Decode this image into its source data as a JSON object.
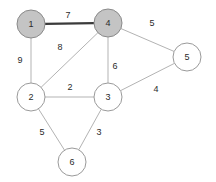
{
  "figure": {
    "type": "weighted-undirected-graph",
    "background_color": "#ffffff",
    "width": 216,
    "height": 182
  },
  "style": {
    "node_fill_default": "#ffffff",
    "node_fill_selected": "#c4c4c4",
    "node_stroke": "#9a9a9a",
    "edge_color": "#b3b3b3",
    "edge_highlight_color": "#3a3a3a",
    "label_color": "#2b2b2b",
    "node_radius": 14
  },
  "chart_data": {
    "type": "graph",
    "title": "",
    "nodes": [
      {
        "id": "1",
        "label": "1",
        "x": 31,
        "y": 24,
        "r": 14,
        "selected": true
      },
      {
        "id": "4",
        "label": "4",
        "x": 108,
        "y": 23,
        "r": 14,
        "selected": true
      },
      {
        "id": "5",
        "label": "5",
        "x": 187,
        "y": 57,
        "r": 14,
        "selected": false
      },
      {
        "id": "2",
        "label": "2",
        "x": 31,
        "y": 97,
        "r": 14,
        "selected": false
      },
      {
        "id": "3",
        "label": "3",
        "x": 108,
        "y": 97,
        "r": 14,
        "selected": false
      },
      {
        "id": "6",
        "label": "6",
        "x": 72,
        "y": 162,
        "r": 14,
        "selected": false
      }
    ],
    "edges": [
      {
        "from": "1",
        "to": "4",
        "weight": "7",
        "label_x": 68,
        "label_y": 16,
        "highlighted": true
      },
      {
        "from": "1",
        "to": "2",
        "weight": "9",
        "label_x": 20,
        "label_y": 61,
        "highlighted": false
      },
      {
        "from": "2",
        "to": "4",
        "weight": "8",
        "label_x": 60,
        "label_y": 48,
        "highlighted": false
      },
      {
        "from": "4",
        "to": "5",
        "weight": "5",
        "label_x": 152,
        "label_y": 24,
        "highlighted": false
      },
      {
        "from": "4",
        "to": "3",
        "weight": "6",
        "label_x": 115,
        "label_y": 67,
        "highlighted": false
      },
      {
        "from": "2",
        "to": "3",
        "weight": "2",
        "label_x": 70,
        "label_y": 88,
        "highlighted": false
      },
      {
        "from": "3",
        "to": "5",
        "weight": "4",
        "label_x": 156,
        "label_y": 90,
        "highlighted": false
      },
      {
        "from": "2",
        "to": "6",
        "weight": "5",
        "label_x": 42,
        "label_y": 133,
        "highlighted": false
      },
      {
        "from": "3",
        "to": "6",
        "weight": "3",
        "label_x": 99,
        "label_y": 133,
        "highlighted": false
      }
    ]
  }
}
